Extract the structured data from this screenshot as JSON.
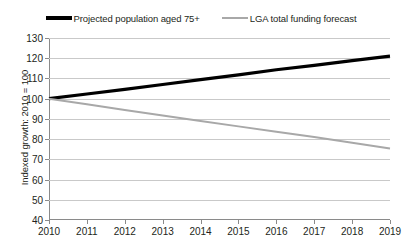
{
  "chart_data": {
    "type": "line",
    "title": "",
    "xlabel": "",
    "ylabel": "Indexed growth: 2010 = 100",
    "x": [
      2010,
      2011,
      2012,
      2013,
      2014,
      2015,
      2016,
      2017,
      2018,
      2019
    ],
    "xtick_labels": [
      "2010",
      "2011",
      "2012",
      "2013",
      "2014",
      "2015",
      "2016",
      "2017",
      "2018",
      "2019"
    ],
    "ytick_labels": [
      "130",
      "120",
      "110",
      "100",
      "90",
      "80",
      "70",
      "60",
      "50",
      "40"
    ],
    "ylim": [
      40,
      130
    ],
    "xlim": [
      2010,
      2019
    ],
    "ytick_step": 10,
    "grid": true,
    "legend_position": "top",
    "series": [
      {
        "name": "Projected population aged 75+",
        "color": "#000000",
        "width": 3.2,
        "values": [
          100,
          102.3,
          104.6,
          107.0,
          109.4,
          111.8,
          114.3,
          116.5,
          118.8,
          121.0
        ]
      },
      {
        "name": "LGA total funding forecast",
        "color": "#a8a8a8",
        "width": 2,
        "values": [
          100,
          97.2,
          94.4,
          91.7,
          89.0,
          86.3,
          83.6,
          81.0,
          78.2,
          75.4
        ]
      }
    ]
  },
  "legend": {
    "items": [
      {
        "label": "Projected population aged 75+",
        "swatch": "series-black"
      },
      {
        "label": "LGA total funding forecast",
        "swatch": "series-grey"
      }
    ]
  }
}
